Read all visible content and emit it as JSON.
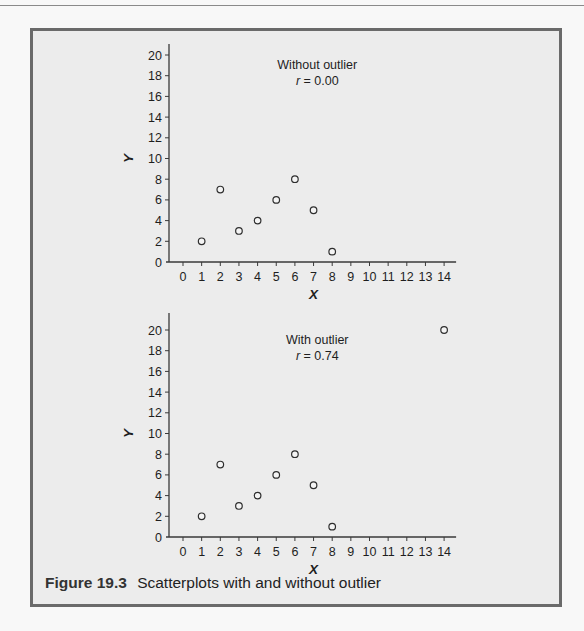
{
  "figure": {
    "number": "Figure 19.3",
    "caption": "Scatterplots with and without outlier",
    "border_color": "#6a6a6a",
    "background_color": "#ececec"
  },
  "chart_data": [
    {
      "type": "scatter",
      "title": "Without outlier",
      "subtitle": "r = 0.00",
      "xlabel": "X",
      "ylabel": "Y",
      "xlim": [
        0,
        14
      ],
      "ylim": [
        0,
        20
      ],
      "x_ticks": [
        0,
        1,
        2,
        3,
        4,
        5,
        6,
        7,
        8,
        9,
        10,
        11,
        12,
        13,
        14
      ],
      "y_ticks": [
        0,
        2,
        4,
        6,
        8,
        10,
        12,
        14,
        16,
        18,
        20
      ],
      "grid": false,
      "legend": null,
      "marker": "open-circle",
      "points": [
        {
          "x": 1,
          "y": 2
        },
        {
          "x": 2,
          "y": 7
        },
        {
          "x": 3,
          "y": 3
        },
        {
          "x": 4,
          "y": 4
        },
        {
          "x": 5,
          "y": 6
        },
        {
          "x": 6,
          "y": 8
        },
        {
          "x": 7,
          "y": 5
        },
        {
          "x": 8,
          "y": 1
        }
      ],
      "annotation": {
        "label": "Without outlier",
        "r_label": "r",
        "r_value": "= 0.00"
      }
    },
    {
      "type": "scatter",
      "title": "With outlier",
      "subtitle": "r = 0.74",
      "xlabel": "X",
      "ylabel": "Y",
      "xlim": [
        0,
        14
      ],
      "ylim": [
        0,
        20
      ],
      "x_ticks": [
        0,
        1,
        2,
        3,
        4,
        5,
        6,
        7,
        8,
        9,
        10,
        11,
        12,
        13,
        14
      ],
      "y_ticks": [
        0,
        2,
        4,
        6,
        8,
        10,
        12,
        14,
        16,
        18,
        20
      ],
      "grid": false,
      "legend": null,
      "marker": "open-circle",
      "points": [
        {
          "x": 1,
          "y": 2
        },
        {
          "x": 2,
          "y": 7
        },
        {
          "x": 3,
          "y": 3
        },
        {
          "x": 4,
          "y": 4
        },
        {
          "x": 5,
          "y": 6
        },
        {
          "x": 6,
          "y": 8
        },
        {
          "x": 7,
          "y": 5
        },
        {
          "x": 8,
          "y": 1
        },
        {
          "x": 14,
          "y": 20
        }
      ],
      "annotation": {
        "label": "With outlier",
        "r_label": "r",
        "r_value": "= 0.74"
      }
    }
  ]
}
